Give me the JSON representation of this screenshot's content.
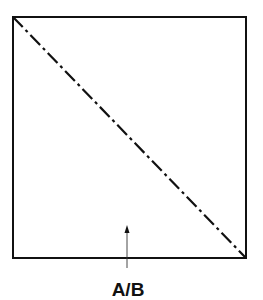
{
  "diagram": {
    "type": "square-with-diagonal",
    "square": {
      "x": 13,
      "y": 17,
      "width": 233,
      "height": 241,
      "stroke": "#111111"
    },
    "diagonal": {
      "x1": 13,
      "y1": 17,
      "x2": 246,
      "y2": 258,
      "style": "dash-dot",
      "stroke": "#111111"
    },
    "pointer_arrow": {
      "x": 127,
      "y_from": 268,
      "y_to": 226
    },
    "label": "A/B"
  }
}
